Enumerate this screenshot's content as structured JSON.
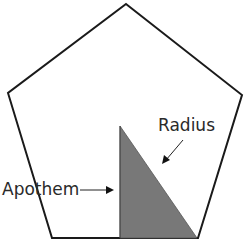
{
  "diagram": {
    "shape": "regular-pentagon",
    "labels": {
      "radius": "Radius",
      "apothem": "Apothem"
    },
    "colors": {
      "outline": "#1a1a1a",
      "triangle_fill": "#787878",
      "background": "#ffffff"
    }
  }
}
